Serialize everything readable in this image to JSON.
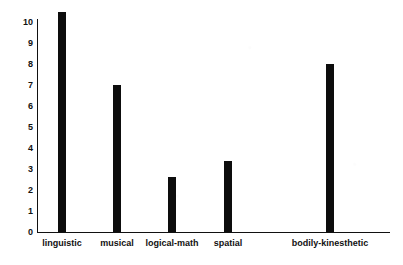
{
  "chart_data": {
    "type": "bar",
    "title": "",
    "subtitle": "",
    "xlabel": "",
    "ylabel": "",
    "categories": [
      "linguistic",
      "musical",
      "logical-math",
      "spatial",
      "bodily-kinesthetic"
    ],
    "values": [
      10.5,
      7,
      2.6,
      3.4,
      8
    ],
    "ylim": [
      0,
      10
    ],
    "yticks": [
      0,
      1,
      2,
      3,
      4,
      5,
      6,
      7,
      8,
      9,
      10
    ],
    "ytick_labels": [
      "0",
      "1",
      "2",
      "3",
      "4",
      "5",
      "6",
      "7",
      "8",
      "9",
      "10"
    ],
    "grid": false,
    "legend": false,
    "legend_position": "none",
    "bar_color": "#0d0d0d",
    "axis_color": "#111111",
    "background_color": "#ffffff",
    "annotations": []
  }
}
